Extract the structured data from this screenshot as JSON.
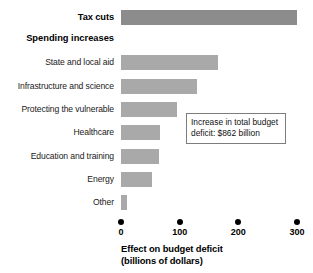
{
  "chart_data": {
    "type": "bar",
    "orientation": "horizontal",
    "title": "",
    "xlabel": "Effect on budget deficit (billions of dollars)",
    "ylabel": "",
    "xlim": [
      0,
      300
    ],
    "xticks": [
      0,
      100,
      200,
      300
    ],
    "xtick_labels": [
      "0",
      "100",
      "200",
      "300"
    ],
    "grid": false,
    "legend": "none",
    "categories": [
      "Tax cuts",
      "State and local aid",
      "Infrastructure and science",
      "Protecting the vulnerable",
      "Healthcare",
      "Education and training",
      "Energy",
      "Other"
    ],
    "values": [
      300,
      165,
      130,
      95,
      67,
      65,
      52,
      11
    ],
    "series": [
      {
        "name": "Effect on budget deficit",
        "values": [
          300,
          165,
          130,
          95,
          67,
          65,
          52,
          11
        ]
      }
    ],
    "group_headings": [
      "Tax cuts",
      "Spending increases"
    ],
    "annotations": [
      {
        "text": "Increase in total budget deficit: $862 billion",
        "value": 862
      }
    ],
    "colors": {
      "tax_cuts_bar": "#8c8c8c",
      "spending_bar": "#a9a9a9",
      "text": "#000000",
      "callout_border": "#7d7d7d",
      "background": "#ffffff"
    }
  },
  "axis": {
    "title_line1": "Effect on budget deficit",
    "title_line2": "(billions of dollars)",
    "ticks": [
      {
        "label": "0",
        "value": 0
      },
      {
        "label": "100",
        "value": 100
      },
      {
        "label": "200",
        "value": 200
      },
      {
        "label": "300",
        "value": 300
      }
    ]
  },
  "rows": [
    {
      "label": "Tax cuts",
      "value": 300,
      "heading": true,
      "dark": true
    },
    {
      "label": "State and local aid",
      "value": 165,
      "heading": false,
      "dark": false
    },
    {
      "label": "Infrastructure and science",
      "value": 130,
      "heading": false,
      "dark": false
    },
    {
      "label": "Protecting the vulnerable",
      "value": 95,
      "heading": false,
      "dark": false
    },
    {
      "label": "Healthcare",
      "value": 67,
      "heading": false,
      "dark": false
    },
    {
      "label": "Education and training",
      "value": 65,
      "heading": false,
      "dark": false
    },
    {
      "label": "Energy",
      "value": 52,
      "heading": false,
      "dark": false
    },
    {
      "label": "Other",
      "value": 11,
      "heading": false,
      "dark": false
    }
  ],
  "section_heading": {
    "label": "Spending increases"
  },
  "callout": {
    "line1": "Increase in total budget",
    "line2": "deficit: $862 billion"
  }
}
